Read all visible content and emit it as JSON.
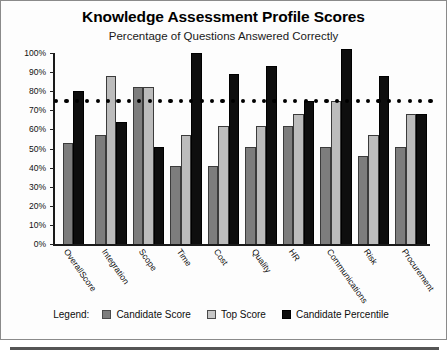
{
  "chart": {
    "title": "Knowledge Assessment Profile Scores",
    "subtitle": "Percentage of Questions Answered Correctly"
  },
  "legend": {
    "title": "Legend:",
    "items": [
      {
        "label": "Candidate Score",
        "color": "#7d7d7d",
        "swatch": "candidate-score-swatch"
      },
      {
        "label": "Top Score",
        "color": "#c6c6c6",
        "swatch": "top-score-swatch"
      },
      {
        "label": "Candidate Percentile",
        "color": "#0e0e0e",
        "swatch": "candidate-percentile-swatch"
      }
    ]
  },
  "chart_data": {
    "type": "bar",
    "title": "Knowledge Assessment Profile Scores",
    "subtitle": "Percentage of Questions Answered Correctly",
    "xlabel": "",
    "ylabel": "",
    "ylim": [
      0,
      100
    ],
    "yticks": [
      "0%",
      "10%",
      "20%",
      "30%",
      "40%",
      "50%",
      "60%",
      "70%",
      "80%",
      "90%",
      "100%"
    ],
    "ytick_values": [
      0,
      10,
      20,
      30,
      40,
      50,
      60,
      70,
      80,
      90,
      100
    ],
    "grid": false,
    "legend_position": "bottom",
    "categories": [
      "OverallScore",
      "Integration",
      "Scope",
      "Time",
      "Cost",
      "Quality",
      "HR",
      "Communications",
      "Risk",
      "Procurement"
    ],
    "series": [
      {
        "name": "Candidate Score",
        "color": "#7d7d7d",
        "values": [
          53,
          57,
          82,
          41,
          41,
          51,
          62,
          51,
          46,
          51
        ]
      },
      {
        "name": "Top Score",
        "color": "#c6c6c6",
        "values": [
          null,
          88,
          82,
          57,
          62,
          62,
          68,
          75,
          57,
          68
        ]
      },
      {
        "name": "Candidate Percentile",
        "color": "#0e0e0e",
        "values": [
          80,
          64,
          51,
          100,
          89,
          93,
          75,
          102,
          88,
          68
        ]
      }
    ],
    "annotations": [
      {
        "type": "threshold-line",
        "style": "dotted",
        "value": 75,
        "label": ""
      }
    ]
  }
}
